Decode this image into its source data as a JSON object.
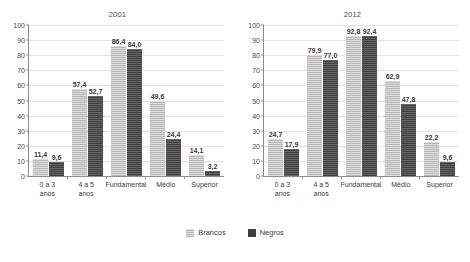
{
  "chart_data": [
    {
      "type": "bar",
      "title": "2001",
      "xlabel": "",
      "ylabel": "",
      "ylim": [
        0,
        100
      ],
      "yticks": [
        0,
        10,
        20,
        30,
        40,
        50,
        60,
        70,
        80,
        90,
        100
      ],
      "ytick_labels": [
        "0",
        "10",
        "20",
        "30",
        "40",
        "50",
        "60",
        "70",
        "80",
        "90",
        "100"
      ],
      "grid": true,
      "legend_position": "bottom-center",
      "categories": [
        "0 a 3 anos",
        "4 a 5 anos",
        "Fundamental",
        "Médio",
        "Superior"
      ],
      "category_lines": [
        [
          "0 a 3",
          "anos"
        ],
        [
          "4 a 5",
          "anos"
        ],
        [
          "Fundamental"
        ],
        [
          "Médio"
        ],
        [
          "Superior"
        ]
      ],
      "series": [
        {
          "name": "Brancos",
          "color": "#b6b6b6",
          "values": [
            11.4,
            57.4,
            86.4,
            49.6,
            14.1
          ],
          "labels": [
            "11,4",
            "57,4",
            "86,4",
            "49,6",
            "14,1"
          ]
        },
        {
          "name": "Negros",
          "color": "#3f3f3f",
          "values": [
            9.6,
            52.7,
            84.0,
            24.4,
            3.2
          ],
          "labels": [
            "9,6",
            "52,7",
            "84,0",
            "24,4",
            "3,2"
          ]
        }
      ]
    },
    {
      "type": "bar",
      "title": "2012",
      "xlabel": "",
      "ylabel": "",
      "ylim": [
        0,
        100
      ],
      "yticks": [
        0,
        10,
        20,
        30,
        40,
        50,
        60,
        70,
        80,
        90,
        100
      ],
      "ytick_labels": [
        "0",
        "10",
        "20",
        "30",
        "40",
        "50",
        "60",
        "70",
        "80",
        "90",
        "100"
      ],
      "grid": true,
      "legend_position": "bottom-center",
      "categories": [
        "0 a 3 anos",
        "4 a 5 anos",
        "Fundamental",
        "Médio",
        "Superior"
      ],
      "category_lines": [
        [
          "0 a 3",
          "anos"
        ],
        [
          "4 a 5",
          "anos"
        ],
        [
          "Fundamental"
        ],
        [
          "Médio"
        ],
        [
          "Superior"
        ]
      ],
      "series": [
        {
          "name": "Brancos",
          "color": "#b6b6b6",
          "values": [
            24.7,
            79.9,
            92.8,
            62.9,
            22.2
          ],
          "labels": [
            "24,7",
            "79,9",
            "92,8",
            "62,9",
            "22,2"
          ]
        },
        {
          "name": "Negros",
          "color": "#3f3f3f",
          "values": [
            17.9,
            77.0,
            92.4,
            47.8,
            9.6
          ],
          "labels": [
            "17,9",
            "77,0",
            "92,4",
            "47,8",
            "9,6"
          ]
        }
      ]
    }
  ],
  "legend": {
    "items": [
      {
        "label": "Brancos",
        "color": "#b6b6b6"
      },
      {
        "label": "Negros",
        "color": "#3f3f3f"
      }
    ]
  }
}
